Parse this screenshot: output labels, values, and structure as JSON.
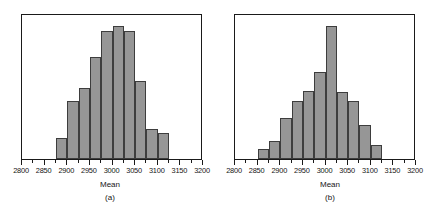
{
  "figure": {
    "background": "#ffffff",
    "bar_fill": "#969696",
    "bar_stroke": "#3d3d3d",
    "frame_color": "#1a1a1a"
  },
  "panels": [
    {
      "caption": "(a)",
      "xlabel": "Mean"
    },
    {
      "caption": "(b)",
      "xlabel": "Mean"
    }
  ],
  "chart_data": [
    {
      "type": "bar",
      "title": "",
      "subtitle": "",
      "panel_label": "(a)",
      "xlabel": "Mean",
      "ylabel": "",
      "xlim": [
        2800,
        3200
      ],
      "ylim": [
        0,
        100
      ],
      "grid": false,
      "legend": "none",
      "bin_width": 25,
      "tick_labels": [
        "2800",
        "2850",
        "2900",
        "2950",
        "3000",
        "3050",
        "3100",
        "3150",
        "3200"
      ],
      "tick_values": [
        2800,
        2850,
        2900,
        2950,
        3000,
        3050,
        3100,
        3150,
        3200
      ],
      "minor_tick_values": [
        2825,
        2875,
        2925,
        2975,
        3025,
        3075,
        3125,
        3175
      ],
      "bin_starts": [
        2875,
        2900,
        2925,
        2950,
        2975,
        3000,
        3025,
        3050,
        3075,
        3100
      ],
      "categories": [
        "2875-2900",
        "2900-2925",
        "2925-2950",
        "2950-2975",
        "2975-3000",
        "3000-3025",
        "3025-3050",
        "3050-3075",
        "3075-3100",
        "3100-3125"
      ],
      "values": [
        15,
        41,
        50,
        72,
        90,
        94,
        90,
        55,
        21,
        18
      ]
    },
    {
      "type": "bar",
      "title": "",
      "subtitle": "",
      "panel_label": "(b)",
      "xlabel": "Mean",
      "ylabel": "",
      "xlim": [
        2800,
        3200
      ],
      "ylim": [
        0,
        100
      ],
      "grid": false,
      "legend": "none",
      "bin_width": 25,
      "tick_labels": [
        "2800",
        "2850",
        "2900",
        "2950",
        "3000",
        "3050",
        "3100",
        "3150",
        "3200"
      ],
      "tick_values": [
        2800,
        2850,
        2900,
        2950,
        3000,
        3050,
        3100,
        3150,
        3200
      ],
      "minor_tick_values": [
        2825,
        2875,
        2925,
        2975,
        3025,
        3075,
        3125,
        3175
      ],
      "bin_starts": [
        2850,
        2875,
        2900,
        2925,
        2950,
        2975,
        3000,
        3025,
        3050,
        3075,
        3100
      ],
      "categories": [
        "2850-2875",
        "2875-2900",
        "2900-2925",
        "2925-2950",
        "2950-2975",
        "2975-3000",
        "3000-3025",
        "3025-3050",
        "3050-3075",
        "3075-3100",
        "3100-3125"
      ],
      "values": [
        7,
        13,
        29,
        41,
        48,
        61,
        94,
        47,
        41,
        24,
        10
      ]
    }
  ]
}
